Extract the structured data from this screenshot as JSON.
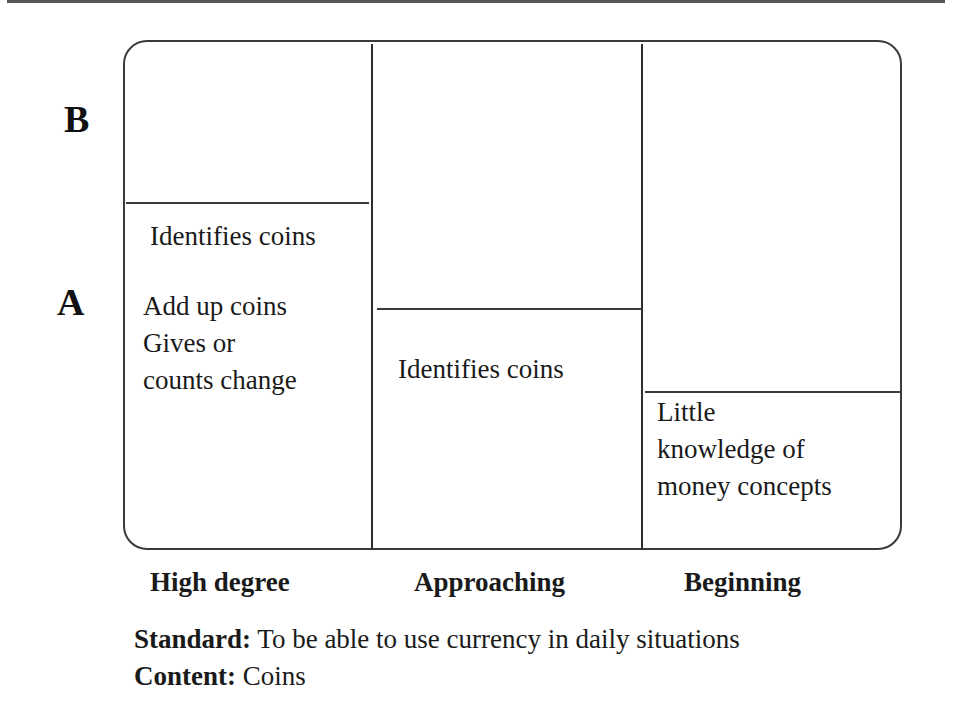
{
  "diagram": {
    "axis": {
      "upper_label": "B",
      "lower_label": "A"
    },
    "columns": [
      {
        "label": "High degree",
        "cells": [
          "Identifies coins",
          "Add up coins",
          "Gives or",
          "counts change"
        ]
      },
      {
        "label": "Approaching",
        "cells": [
          "Identifies coins"
        ]
      },
      {
        "label": "Beginning",
        "cells": [
          "Little",
          "knowledge of",
          "money concepts"
        ]
      }
    ]
  },
  "caption": {
    "standard_label": "Standard:",
    "standard_text": " To be able to use currency in daily situations",
    "content_label": "Content:",
    "content_text": " Coins"
  }
}
